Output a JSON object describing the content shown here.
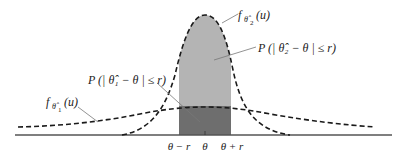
{
  "diagram": {
    "title": "",
    "colors": {
      "background": "#ffffff",
      "axis": "#555555",
      "curve": "#1a1a1a",
      "light_fill": "#b4b4b4",
      "dark_fill": "#6e6e6e",
      "leader": "#777777"
    },
    "curves": [
      {
        "id": "narrow",
        "label_f": "f",
        "label_sub": "θ̂",
        "label_subsub": "2",
        "label_arg": "(u)",
        "description": "f_θ̂2(u), narrow density centered at θ"
      },
      {
        "id": "wide",
        "label_f": "f",
        "label_sub": "θ̂",
        "label_subsub": "1",
        "label_arg": "(u)",
        "description": "f_θ̂1(u), wide density centered at θ"
      }
    ],
    "annotations": {
      "p2": "P (| θ̂₂ − θ | ≤ r)",
      "p1": "P (| θ̂₁ − θ | ≤ r)"
    },
    "axis_ticks": [
      "θ − r",
      "θ",
      "θ + r"
    ]
  }
}
